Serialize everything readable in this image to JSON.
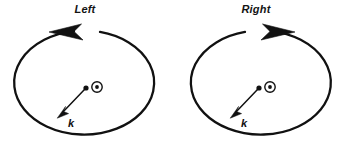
{
  "figure": {
    "background_color": "#ffffff",
    "stroke_color": "#111111",
    "width": 341,
    "height": 148,
    "panel_count": 2
  },
  "panels": [
    {
      "id": "left",
      "title": "Left",
      "handedness": "counterclockwise",
      "arrow_head_direction": "left",
      "ellipse": {
        "cx": 83,
        "cy": 83,
        "rx": 70,
        "ry": 52
      },
      "center_symbol": {
        "name": "circle-dot-symbol",
        "glyph": "⊙",
        "meaning": "vector out of page",
        "cx": 97,
        "cy": 87,
        "outer_r": 5.2,
        "inner_r": 1.9
      },
      "k_vector": {
        "label": "k",
        "tail_x": 86,
        "tail_y": 88,
        "tip_x": 58,
        "tip_y": 117,
        "tail_dot_r": 2.6,
        "label_x": 71,
        "label_y": 127
      }
    },
    {
      "id": "right",
      "title": "Right",
      "handedness": "clockwise",
      "arrow_head_direction": "right",
      "ellipse": {
        "cx": 85,
        "cy": 83,
        "rx": 70,
        "ry": 52
      },
      "center_symbol": {
        "name": "circle-dot-symbol",
        "glyph": "⊙",
        "meaning": "vector out of page",
        "cx": 99,
        "cy": 87,
        "outer_r": 5.2,
        "inner_r": 1.9
      },
      "k_vector": {
        "label": "k",
        "tail_x": 88,
        "tail_y": 88,
        "tip_x": 60,
        "tip_y": 117,
        "tail_dot_r": 2.6,
        "label_x": 73,
        "label_y": 127
      }
    }
  ]
}
